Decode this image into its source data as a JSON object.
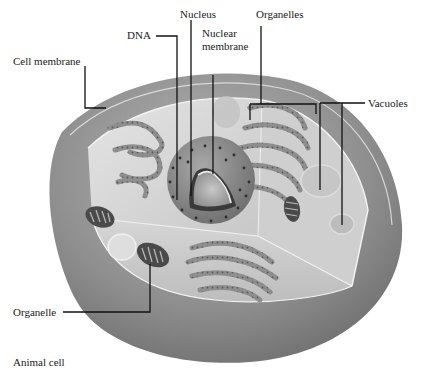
{
  "diagram": {
    "caption": "Animal cell",
    "labels": {
      "nucleus": "Nucleus",
      "dna": "DNA",
      "nuclear_membrane_line1": "Nuclear",
      "nuclear_membrane_line2": "membrane",
      "organelles_top": "Organelles",
      "cell_membrane": "Cell membrane",
      "vacuoles": "Vacuoles",
      "organelle_bottom": "Organelle"
    },
    "colors": {
      "background": "#ffffff",
      "cytoplasm_outer": "#8a8a8a",
      "cytoplasm_inner": "#d8d8d8",
      "leader_line": "#111111",
      "text": "#1a1a1a"
    }
  }
}
